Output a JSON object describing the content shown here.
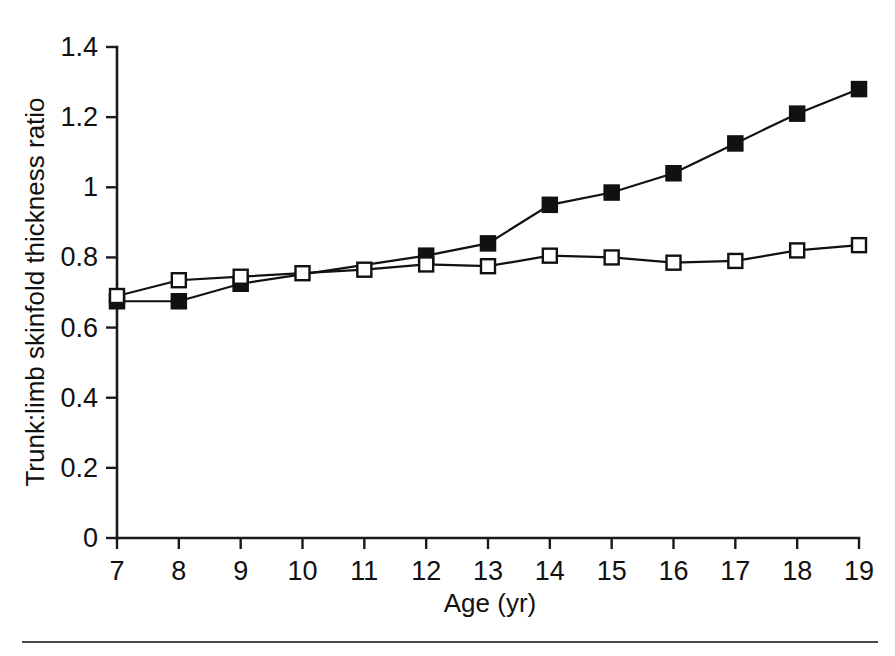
{
  "chart_data": {
    "type": "line",
    "title": "",
    "xlabel": "Age (yr)",
    "ylabel": "Trunk:limb skinfold thickness ratio",
    "x": [
      7,
      8,
      9,
      10,
      11,
      12,
      13,
      14,
      15,
      16,
      17,
      18,
      19
    ],
    "xlim": [
      7,
      19
    ],
    "ylim": [
      0,
      1.4
    ],
    "xticks": [
      "7",
      "8",
      "9",
      "10",
      "11",
      "12",
      "13",
      "14",
      "15",
      "16",
      "17",
      "18",
      "19"
    ],
    "yticks": [
      "0",
      "0.2",
      "0.4",
      "0.6",
      "0.8",
      "1",
      "1.2",
      "1.4"
    ],
    "ytick_values": [
      0,
      0.2,
      0.4,
      0.6,
      0.8,
      1,
      1.2,
      1.4
    ],
    "grid": false,
    "legend_position": "none",
    "series": [
      {
        "name": "filled-square-series",
        "marker": "filled-square",
        "values": [
          0.675,
          0.675,
          0.725,
          null,
          null,
          0.805,
          0.84,
          0.95,
          0.985,
          1.04,
          1.125,
          1.21,
          1.28
        ]
      },
      {
        "name": "open-square-series",
        "marker": "open-square",
        "values": [
          0.69,
          0.735,
          0.745,
          0.755,
          0.765,
          0.78,
          0.775,
          0.805,
          0.8,
          0.785,
          0.79,
          0.82,
          0.835
        ]
      }
    ]
  },
  "colors": {
    "axis": "#1a1a1a",
    "line": "#111111",
    "marker_fill": "#111111",
    "marker_open_fill": "#ffffff",
    "background": "#ffffff",
    "footer_rule": "#4a4a4a"
  },
  "geometry": {
    "plot_left": 117,
    "plot_right": 859,
    "plot_bottom": 538,
    "plot_top": 47,
    "marker_size_filled": 15,
    "marker_size_open": 14
  }
}
